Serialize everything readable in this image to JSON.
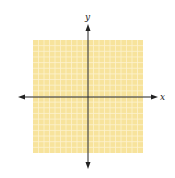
{
  "diagram": {
    "type": "coordinate-plane",
    "x_axis_label": "x",
    "y_axis_label": "y",
    "grid": {
      "columns": 20,
      "rows": 20,
      "fill_color": "#f7e39c",
      "line_color": "#fdf3cf"
    },
    "axis_color": "#222222"
  }
}
